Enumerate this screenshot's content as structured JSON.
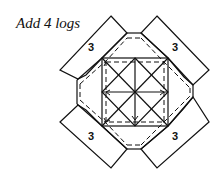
{
  "caption": "Add 4 logs",
  "diagram": {
    "log_labels": [
      "3",
      "3",
      "3",
      "3"
    ],
    "stroke_color": "#111111",
    "background": "#ffffff"
  }
}
